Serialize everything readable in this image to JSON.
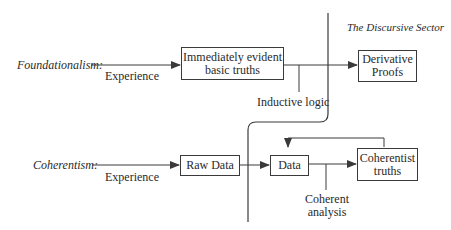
{
  "diagram": {
    "sector_title": "The Discursive Sector",
    "foundationalism": {
      "label": "Foundationalism:",
      "input_edge": "Experience",
      "basic_box": {
        "line1": "Immediately evident",
        "line2": "basic truths"
      },
      "inference_edge": "Inductive logic",
      "output_box": {
        "line1": "Derivative",
        "line2": "Proofs"
      }
    },
    "coherentism": {
      "label": "Coherentism:",
      "input_edge": "Experience",
      "raw_box": {
        "line1": "Raw Data"
      },
      "data_box": {
        "line1": "Data"
      },
      "inference_edge": {
        "line1": "Coherent",
        "line2": "analysis"
      },
      "output_box": {
        "line1": "Coherentist",
        "line2": "truths"
      }
    }
  },
  "colors": {
    "line": "#3a3a3a",
    "text": "#2a2a2a",
    "background": "#ffffff"
  }
}
